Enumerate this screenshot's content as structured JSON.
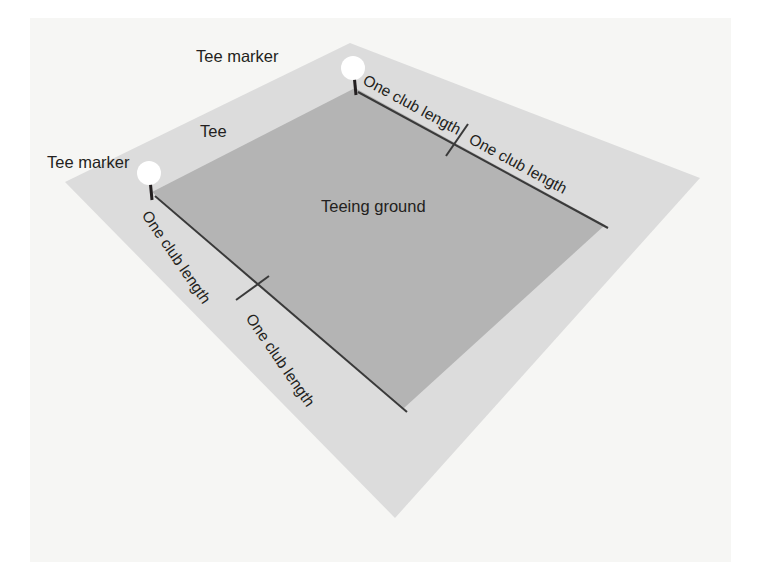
{
  "figure": {
    "background_color": "#f6f6f4",
    "page_color": "#ffffff"
  },
  "regions": [
    {
      "name": "tee",
      "label": "Tee",
      "fill": "#dcdcdc",
      "points": "350,43 700,178 395,518 65,182"
    },
    {
      "name": "teeing-ground",
      "label": "Teeing ground",
      "fill": "#b4b4b4",
      "points": "355,88 605,225 404,408 152,192"
    }
  ],
  "labels": {
    "teeing_ground": "Teeing ground",
    "tee": "Tee",
    "tee_marker_top": "Tee marker",
    "tee_marker_left": "Tee marker",
    "club_length_top_right_1": "One club length",
    "club_length_top_right_2": "One club length",
    "club_length_bottom_left_1": "One club length",
    "club_length_bottom_left_2": "One club length"
  },
  "markers": [
    {
      "name": "tee-marker-top",
      "cx": 353,
      "cy": 68,
      "r": 12,
      "fill": "#ffffff",
      "stem_to_x": 355,
      "stem_to_y": 93
    },
    {
      "name": "tee-marker-left",
      "cx": 149,
      "cy": 173,
      "r": 12,
      "fill": "#ffffff",
      "stem_to_x": 152,
      "stem_to_y": 197
    }
  ],
  "measure_lines": [
    {
      "name": "measure-top-right",
      "x1": 358,
      "y1": 92,
      "x2": 608,
      "y2": 228,
      "stroke": "#3a3a3a"
    },
    {
      "name": "measure-bottom-left",
      "x1": 155,
      "y1": 196,
      "x2": 407,
      "y2": 412,
      "stroke": "#3a3a3a"
    }
  ],
  "tick_marks": [
    {
      "name": "tick-top-right",
      "x1": 446,
      "y1": 156,
      "x2": 468,
      "y2": 124,
      "stroke": "#3a3a3a"
    },
    {
      "name": "tick-bottom-left",
      "x1": 236,
      "y1": 300,
      "x2": 269,
      "y2": 276,
      "stroke": "#3a3a3a"
    }
  ],
  "colors": {
    "outer_region": "#dcdcdc",
    "inner_region": "#b4b4b4",
    "text": "#231f20",
    "line": "#3a3a3a",
    "marker": "#ffffff",
    "background": "#f6f6f4"
  }
}
